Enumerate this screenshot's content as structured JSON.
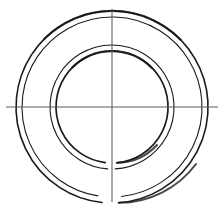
{
  "figure": {
    "background_color": "#ffffff",
    "stroke_color": "#1a1a1a",
    "centerline_color": "#5a5a5a",
    "canvas": {
      "width": 223,
      "height": 211
    }
  },
  "geometry": {
    "center": {
      "x": 112,
      "y": 107,
      "label": "center"
    },
    "circles": [
      {
        "name": "outer-ring-outer-edge",
        "radius": 96,
        "stroke_width": 1.6,
        "gap": {
          "start_deg": 86,
          "end_deg": 96,
          "note": "small break at bottom near vertical centerline"
        }
      },
      {
        "name": "outer-ring-inner-edge",
        "radius": 90,
        "stroke_width": 1.1,
        "gap": {
          "start_deg": 84,
          "end_deg": 99,
          "note": "small break at bottom near vertical centerline"
        }
      },
      {
        "name": "inner-ring-outer-edge",
        "radius": 62,
        "stroke_width": 1.1,
        "gap": {
          "start_deg": 87,
          "end_deg": 94,
          "note": "hairline break at bottom"
        }
      },
      {
        "name": "inner-ring-inner-edge",
        "radius": 56,
        "stroke_width": 1.7,
        "gap": {
          "start_deg": 85,
          "end_deg": 97,
          "note": "small break at bottom near vertical centerline"
        }
      }
    ],
    "centerlines": [
      {
        "name": "horizontal-centerline",
        "orientation": "horizontal",
        "x1": 6,
        "y1": 107,
        "x2": 218,
        "y2": 107
      },
      {
        "name": "vertical-centerline",
        "orientation": "vertical",
        "x1": 112,
        "y1": 9,
        "x2": 112,
        "y2": 202
      }
    ],
    "axis_intersections": {
      "horizontal_left": [
        16,
        22,
        50,
        56
      ],
      "horizontal_right": [
        168,
        174,
        202,
        208
      ],
      "vertical_top": [
        11,
        17,
        45,
        51
      ],
      "vertical_bottom": [
        163,
        169,
        197,
        203
      ]
    }
  },
  "scan_artifacts": [
    {
      "name": "speck-left-upper",
      "x": 17,
      "y": 99,
      "r": 0.6
    },
    {
      "name": "speck-left-mid",
      "x": 51,
      "y": 102,
      "r": 0.5
    }
  ]
}
